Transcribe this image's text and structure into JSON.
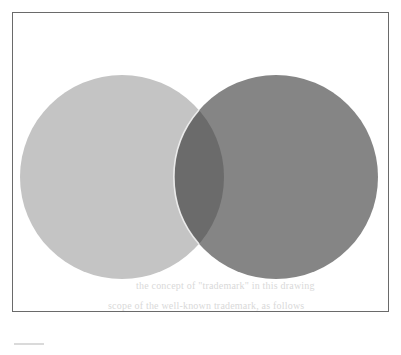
{
  "figure": {
    "type": "venn-diagram",
    "frame": {
      "border_color": "#6a6a6a"
    },
    "sets": [
      {
        "id": "left",
        "shape": "circle",
        "cx": 122,
        "cy": 177,
        "r": 102,
        "fill": "#c4c4c4"
      },
      {
        "id": "right",
        "shape": "circle",
        "cx": 276,
        "cy": 177,
        "r": 102,
        "fill": "#858585"
      }
    ],
    "intersection": {
      "fill": "#6b6b6b",
      "edge_highlight": "#f2f2f2"
    }
  },
  "bleed_through_text": {
    "line1": "the concept of \"trademark\" in this drawing",
    "line2": "scope of the well-known trademark, as follows"
  }
}
